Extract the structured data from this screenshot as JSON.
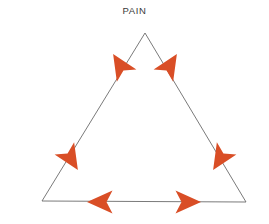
{
  "figure": {
    "title": "PAIN",
    "background_color": "#ffffff",
    "width": 269,
    "height": 224
  },
  "diagram": {
    "type": "triangle-with-directional-arrowheads",
    "shape_name": "triangle",
    "stroke_color": "#6b6b6b",
    "stroke_width": 0.9,
    "arrow_color": "#d94e26",
    "vertices": [
      {
        "name": "apex",
        "x": 145,
        "y": 33
      },
      {
        "name": "bottom-left",
        "x": 42,
        "y": 201
      },
      {
        "name": "bottom-right",
        "x": 246,
        "y": 202
      }
    ],
    "edges": [
      {
        "name": "left-edge",
        "from": "apex",
        "to": "bottom-left"
      },
      {
        "name": "right-edge",
        "from": "apex",
        "to": "bottom-right"
      },
      {
        "name": "bottom-edge",
        "from": "bottom-left",
        "to": "bottom-right"
      }
    ],
    "arrows": [
      {
        "name": "arrow-left-edge-upper",
        "edge": "left-edge",
        "direction": "up-right",
        "cx": 120,
        "cy": 65,
        "angle": -122,
        "size": 25
      },
      {
        "name": "arrow-right-edge-upper",
        "edge": "right-edge",
        "direction": "up-left",
        "cx": 170,
        "cy": 65,
        "angle": -58,
        "size": 25
      },
      {
        "name": "arrow-left-edge-lower",
        "edge": "left-edge",
        "direction": "down-left",
        "cx": 71,
        "cy": 159,
        "angle": 58,
        "size": 25
      },
      {
        "name": "arrow-right-edge-lower",
        "edge": "right-edge",
        "direction": "down-right",
        "cx": 220,
        "cy": 159,
        "angle": 122,
        "size": 25
      },
      {
        "name": "arrow-bottom-edge-left",
        "edge": "bottom-edge",
        "direction": "left",
        "cx": 100,
        "cy": 202,
        "angle": 180,
        "size": 25
      },
      {
        "name": "arrow-bottom-edge-right",
        "edge": "bottom-edge",
        "direction": "right",
        "cx": 188,
        "cy": 202,
        "angle": 0,
        "size": 25
      }
    ]
  }
}
